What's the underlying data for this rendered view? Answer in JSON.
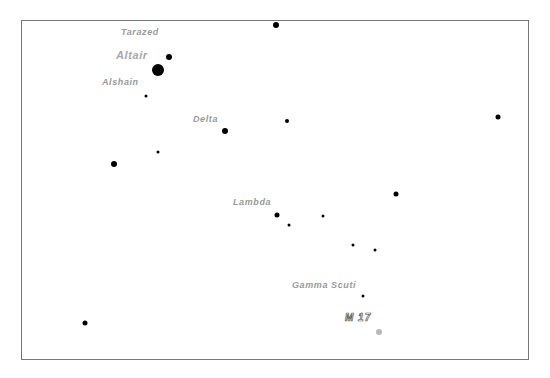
{
  "chart": {
    "frame": {
      "left": 21,
      "top": 20,
      "right": 529,
      "bottom": 360
    },
    "labels": [
      {
        "id": "tarazed",
        "text": "Tarazed",
        "x": 121,
        "y": 33,
        "cls": ""
      },
      {
        "id": "altair",
        "text": "Altair",
        "x": 116,
        "y": 55,
        "cls": "big"
      },
      {
        "id": "alshain",
        "text": "Alshain",
        "x": 102,
        "y": 83,
        "cls": ""
      },
      {
        "id": "delta",
        "text": "Delta",
        "x": 193,
        "y": 120,
        "cls": ""
      },
      {
        "id": "lambda",
        "text": "Lambda",
        "x": 233,
        "y": 203,
        "cls": ""
      },
      {
        "id": "gamma-scuti",
        "text": "Gamma  Scuti",
        "x": 292,
        "y": 286,
        "cls": ""
      },
      {
        "id": "m17",
        "text": "M 17",
        "x": 345,
        "y": 318,
        "cls": "m17"
      }
    ],
    "stars": [
      {
        "name": "star-top",
        "x": 276,
        "y": 25,
        "r": 6
      },
      {
        "name": "star-tarazed",
        "x": 169,
        "y": 57,
        "r": 6
      },
      {
        "name": "star-altair",
        "x": 158,
        "y": 70,
        "r": 12
      },
      {
        "name": "star-alshain",
        "x": 146,
        "y": 96,
        "r": 3
      },
      {
        "name": "star-delta",
        "x": 225,
        "y": 131,
        "r": 6
      },
      {
        "name": "star-e1",
        "x": 287,
        "y": 121,
        "r": 4
      },
      {
        "name": "star-e2",
        "x": 498,
        "y": 117,
        "r": 5
      },
      {
        "name": "star-w1",
        "x": 114,
        "y": 164,
        "r": 6
      },
      {
        "name": "star-w2",
        "x": 158,
        "y": 152,
        "r": 3
      },
      {
        "name": "star-e3",
        "x": 396,
        "y": 194,
        "r": 5
      },
      {
        "name": "star-lambda",
        "x": 277,
        "y": 215,
        "r": 5
      },
      {
        "name": "star-l1",
        "x": 289,
        "y": 225,
        "r": 3
      },
      {
        "name": "star-l2",
        "x": 323,
        "y": 216,
        "r": 3
      },
      {
        "name": "star-l3",
        "x": 353,
        "y": 245,
        "r": 3
      },
      {
        "name": "star-l4",
        "x": 375,
        "y": 250,
        "r": 3
      },
      {
        "name": "star-gamma-scuti",
        "x": 363,
        "y": 296,
        "r": 3
      },
      {
        "name": "star-sw",
        "x": 85,
        "y": 323,
        "r": 5
      }
    ],
    "dsos": [
      {
        "name": "m17-marker",
        "x": 379,
        "y": 332,
        "r": 6
      }
    ]
  }
}
